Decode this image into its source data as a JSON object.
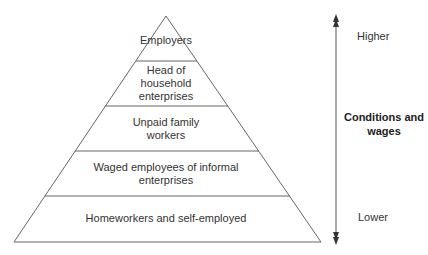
{
  "pyramid": {
    "tiers": [
      {
        "label": "Employers"
      },
      {
        "label": "Head of household enterprises"
      },
      {
        "label": "Unpaid family workers"
      },
      {
        "label": "Waged employees of informal enterprises"
      },
      {
        "label": "Homeworkers and self-employed"
      }
    ]
  },
  "tier_lines": {
    "t0": [
      "Employers"
    ],
    "t1": [
      "Head of",
      "household",
      "enterprises"
    ],
    "t2": [
      "Unpaid family",
      "workers"
    ],
    "t3": [
      "Waged employees of informal",
      "enterprises"
    ],
    "t4": [
      "Homeworkers and self-employed"
    ]
  },
  "axis": {
    "top_label": "Higher",
    "bottom_label": "Lower",
    "title_line1": "Conditions and",
    "title_line2": "wages"
  },
  "colors": {
    "line": "#555555",
    "text": "#333333"
  }
}
